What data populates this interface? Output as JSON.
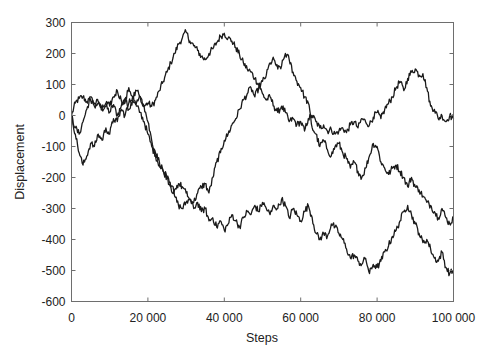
{
  "chart_data": {
    "type": "line",
    "title": "",
    "xlabel": "Steps",
    "ylabel": "Displacement",
    "xlim": [
      0,
      100000
    ],
    "ylim": [
      -600,
      300
    ],
    "grid": false,
    "legend": null,
    "x_ticks": [
      0,
      20000,
      40000,
      60000,
      80000,
      100000
    ],
    "x_tick_labels": [
      "0",
      "20 000",
      "40 000",
      "60 000",
      "80 000",
      "100 000"
    ],
    "y_ticks": [
      300,
      200,
      100,
      0,
      -100,
      -200,
      -300,
      -400,
      -500,
      -600
    ],
    "y_tick_labels": [
      "300",
      "200",
      "100",
      "0",
      "-100",
      "-200",
      "-300",
      "-400",
      "-500",
      "-600"
    ],
    "x_step": 1000,
    "series": [
      {
        "name": "walk-1",
        "color": "#1a1a1a",
        "values": [
          0,
          40,
          55,
          60,
          45,
          50,
          40,
          45,
          20,
          30,
          10,
          35,
          0,
          30,
          55,
          20,
          50,
          40,
          60,
          30,
          40,
          30,
          50,
          80,
          110,
          140,
          170,
          200,
          230,
          250,
          270,
          240,
          225,
          210,
          190,
          180,
          200,
          215,
          235,
          255,
          265,
          250,
          240,
          220,
          195,
          170,
          150,
          140,
          120,
          100,
          70,
          50,
          60,
          30,
          10,
          30,
          10,
          -20,
          -10,
          -30,
          -20,
          -50,
          -10,
          0,
          -20,
          -40,
          -30,
          -50,
          -45,
          -60,
          -50,
          -40,
          -55,
          -30,
          -20,
          -40,
          -10,
          -20,
          -30,
          -5,
          10,
          -10,
          20,
          40,
          60,
          90,
          110,
          80,
          120,
          140,
          150,
          130,
          135,
          90,
          30,
          20,
          -10,
          0,
          -20,
          0,
          -10
        ]
      },
      {
        "name": "walk-2",
        "color": "#1a1a1a",
        "values": [
          0,
          -40,
          -60,
          -20,
          20,
          60,
          30,
          40,
          20,
          40,
          30,
          60,
          80,
          50,
          40,
          90,
          60,
          30,
          10,
          -20,
          -60,
          -100,
          -130,
          -160,
          -180,
          -200,
          -230,
          -260,
          -290,
          -300,
          -280,
          -270,
          -280,
          -250,
          -230,
          -220,
          -250,
          -200,
          -150,
          -120,
          -80,
          -60,
          -30,
          -10,
          20,
          50,
          70,
          90,
          60,
          90,
          110,
          130,
          170,
          180,
          150,
          160,
          200,
          180,
          140,
          110,
          90,
          60,
          40,
          -40,
          -60,
          -100,
          -80,
          -110,
          -130,
          -100,
          -90,
          -120,
          -140,
          -170,
          -150,
          -180,
          -200,
          -170,
          -130,
          -90,
          -100,
          -150,
          -170,
          -190,
          -170,
          -160,
          -180,
          -200,
          -230,
          -200,
          -230,
          -240,
          -260,
          -280,
          -290,
          -310,
          -330,
          -300,
          -330,
          -350,
          -330
        ]
      },
      {
        "name": "walk-3",
        "color": "#1a1a1a",
        "values": [
          0,
          -60,
          -120,
          -160,
          -130,
          -90,
          -100,
          -60,
          -80,
          -40,
          -60,
          -10,
          -20,
          20,
          0,
          40,
          60,
          80,
          60,
          30,
          -20,
          -80,
          -120,
          -150,
          -180,
          -200,
          -230,
          -240,
          -220,
          -230,
          -250,
          -270,
          -300,
          -280,
          -310,
          -300,
          -340,
          -330,
          -360,
          -340,
          -370,
          -350,
          -320,
          -340,
          -360,
          -330,
          -310,
          -320,
          -290,
          -310,
          -280,
          -300,
          -320,
          -290,
          -300,
          -270,
          -290,
          -330,
          -300,
          -320,
          -340,
          -310,
          -290,
          -330,
          -380,
          -400,
          -380,
          -390,
          -350,
          -360,
          -380,
          -400,
          -430,
          -460,
          -450,
          -470,
          -480,
          -460,
          -510,
          -480,
          -490,
          -470,
          -440,
          -420,
          -390,
          -370,
          -340,
          -310,
          -290,
          -320,
          -350,
          -380,
          -410,
          -400,
          -430,
          -460,
          -470,
          -440,
          -490,
          -510,
          -500
        ]
      }
    ]
  }
}
